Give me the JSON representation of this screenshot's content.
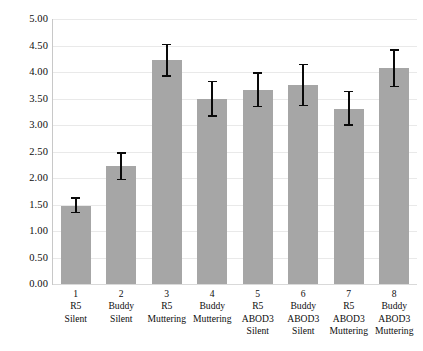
{
  "chart_data": {
    "type": "bar",
    "title": "",
    "subtitle": "",
    "xlabel": "",
    "ylabel": "",
    "ylim": [
      0,
      5
    ],
    "ytick_step": 0.5,
    "grid": true,
    "legend": null,
    "bar_color": "#a6a6a6",
    "error_bar_color": "#0a0a0a",
    "ytick_labels": [
      "5.00",
      "4.50",
      "4.00",
      "3.50",
      "3.00",
      "2.50",
      "2.00",
      "1.50",
      "1.00",
      "0.50",
      "0.00"
    ],
    "ytick_values": [
      5.0,
      4.5,
      4.0,
      3.5,
      3.0,
      2.5,
      2.0,
      1.5,
      1.0,
      0.5,
      0.0
    ],
    "categories": [
      "1",
      "2",
      "3",
      "4",
      "5",
      "6",
      "7",
      "8"
    ],
    "category_lines": [
      [
        "1",
        "R5",
        "Silent"
      ],
      [
        "2",
        "Buddy",
        "Silent"
      ],
      [
        "3",
        "R5",
        "Muttering"
      ],
      [
        "4",
        "Buddy",
        "Muttering"
      ],
      [
        "5",
        "R5",
        "ABOD3",
        "Silent"
      ],
      [
        "6",
        "Buddy",
        "ABOD3",
        "Silent"
      ],
      [
        "7",
        "R5",
        "ABOD3",
        "Muttering"
      ],
      [
        "8",
        "Buddy",
        "ABOD3",
        "Muttering"
      ]
    ],
    "values": [
      1.48,
      2.22,
      4.22,
      3.49,
      3.66,
      3.76,
      3.31,
      4.08
    ],
    "error_low": [
      1.35,
      1.97,
      3.92,
      3.17,
      3.35,
      3.37,
      3.0,
      3.73
    ],
    "error_high": [
      1.62,
      2.47,
      4.52,
      3.82,
      3.98,
      4.14,
      3.63,
      4.42
    ]
  }
}
